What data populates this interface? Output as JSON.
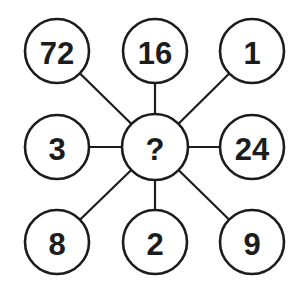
{
  "puzzle": {
    "center": {
      "label": "?",
      "x": 155,
      "y": 147
    },
    "radius": 32,
    "nodes": [
      {
        "id": "top-left",
        "label": "72",
        "x": 57,
        "y": 51
      },
      {
        "id": "top-middle",
        "label": "16",
        "x": 155,
        "y": 51
      },
      {
        "id": "top-right",
        "label": "1",
        "x": 252,
        "y": 51
      },
      {
        "id": "middle-left",
        "label": "3",
        "x": 57,
        "y": 147
      },
      {
        "id": "middle-right",
        "label": "24",
        "x": 252,
        "y": 147
      },
      {
        "id": "bottom-left",
        "label": "8",
        "x": 57,
        "y": 242
      },
      {
        "id": "bottom-middle",
        "label": "2",
        "x": 155,
        "y": 242
      },
      {
        "id": "bottom-right",
        "label": "9",
        "x": 252,
        "y": 242
      }
    ],
    "colors": {
      "stroke": "#1c1c1c",
      "fill": "#ffffff",
      "background": "#ffffff"
    }
  }
}
